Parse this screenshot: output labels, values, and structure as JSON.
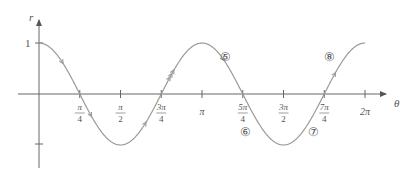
{
  "chart_data": {
    "type": "line",
    "title": "",
    "function": "r = cos 2θ",
    "xlabel": "θ",
    "ylabel": "r",
    "xlim": [
      0,
      6.2832
    ],
    "ylim": [
      -1,
      1
    ],
    "grid": false,
    "x_ticks": [
      {
        "value": 0.7854,
        "num": "π",
        "den": "4"
      },
      {
        "value": 1.5708,
        "num": "π",
        "den": "2"
      },
      {
        "value": 2.3562,
        "num": "3π",
        "den": "4"
      },
      {
        "value": 3.1416,
        "label": "π"
      },
      {
        "value": 3.927,
        "num": "5π",
        "den": "4"
      },
      {
        "value": 4.7124,
        "num": "3π",
        "den": "2"
      },
      {
        "value": 5.4978,
        "num": "7π",
        "den": "4"
      },
      {
        "value": 6.2832,
        "label": "2π"
      }
    ],
    "y_ticks": [
      {
        "value": 1,
        "label": "1"
      },
      {
        "value": -1,
        "label": ""
      }
    ],
    "series": [
      {
        "name": "cos 2θ",
        "color": "#9a9a9a",
        "x": [
          0,
          0.3927,
          0.7854,
          1.1781,
          1.5708,
          1.9635,
          2.3562,
          2.7489,
          3.1416,
          3.5343,
          3.927,
          4.3197,
          4.7124,
          5.1051,
          5.4978,
          5.8905,
          6.2832
        ],
        "values": [
          1,
          0.707,
          0,
          -0.707,
          -1,
          -0.707,
          0,
          0.707,
          1,
          0.707,
          0,
          -0.707,
          -1,
          -0.707,
          0,
          0.707,
          1
        ]
      }
    ],
    "annotations": [
      {
        "label": "⑤",
        "x": 3.6,
        "y": 0.72
      },
      {
        "label": "⑥",
        "x": 3.98,
        "y": -0.75
      },
      {
        "label": "⑦",
        "x": 5.3,
        "y": -0.75
      },
      {
        "label": "⑧",
        "x": 5.6,
        "y": 0.72
      }
    ]
  }
}
